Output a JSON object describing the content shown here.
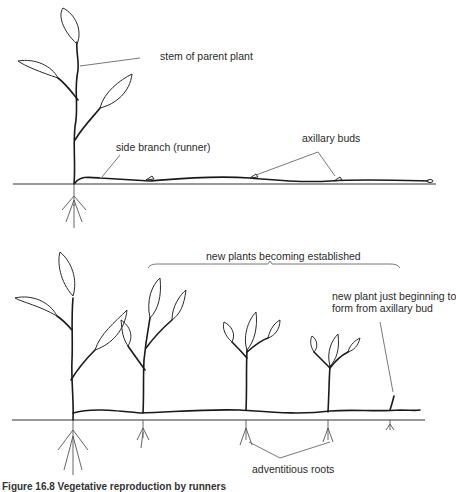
{
  "diagram": {
    "top_panel": {
      "labels": {
        "stem": "stem of parent plant",
        "runner": "side branch (runner)",
        "buds": "axillary buds"
      }
    },
    "bottom_panel": {
      "labels": {
        "established": "new plants becoming established",
        "new_plant": "new plant just beginning to",
        "new_plant_2": "form from axillary bud",
        "roots": "adventitious roots"
      }
    },
    "caption": "Figure 16.8  Vegetative reproduction by runners"
  }
}
